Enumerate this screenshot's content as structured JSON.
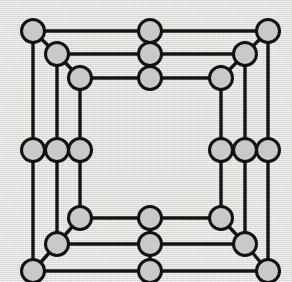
{
  "figure": {
    "canvas": {
      "width": 292,
      "height": 282
    },
    "style": {
      "background_color": "#f1f1ef",
      "edge_color": "#141414",
      "node_fill_color": "#c9c9c7",
      "node_stroke_color": "#121212",
      "edge_stroke_width": 3.4,
      "node_stroke_width": 3.0,
      "node_radius": 11.5
    },
    "counts": {
      "vertices": 24,
      "edges": 36,
      "rings": 3,
      "symmetry": "4-fold"
    }
  },
  "chart_data": {
    "type": "scatter",
    "xlabel": "",
    "ylabel": "",
    "xlim": [
      0,
      292
    ],
    "ylim": [
      0,
      282
    ],
    "grid": false,
    "legend": "none",
    "nodes": [
      {
        "id": "n01",
        "label": "outer-top-left",
        "x": 33,
        "y": 31,
        "r": 11.5
      },
      {
        "id": "n02",
        "label": "mid-top-left",
        "x": 57,
        "y": 54,
        "r": 11.5
      },
      {
        "id": "n03",
        "label": "inner-top-left",
        "x": 80,
        "y": 78,
        "r": 11.5
      },
      {
        "id": "n04",
        "label": "outer-top-center",
        "x": 150,
        "y": 31,
        "r": 11.5
      },
      {
        "id": "n05",
        "label": "mid-top-center",
        "x": 150,
        "y": 54,
        "r": 11.5
      },
      {
        "id": "n06",
        "label": "inner-top-center",
        "x": 150,
        "y": 78,
        "r": 11.5
      },
      {
        "id": "n07",
        "label": "outer-top-right",
        "x": 268,
        "y": 31,
        "r": 11.5
      },
      {
        "id": "n08",
        "label": "mid-top-right",
        "x": 245,
        "y": 54,
        "r": 11.5
      },
      {
        "id": "n09",
        "label": "inner-top-right",
        "x": 221,
        "y": 78,
        "r": 11.5
      },
      {
        "id": "n10",
        "label": "outer-left-middle",
        "x": 33,
        "y": 150,
        "r": 11.5
      },
      {
        "id": "n11",
        "label": "mid-left-middle",
        "x": 57,
        "y": 150,
        "r": 11.5
      },
      {
        "id": "n12",
        "label": "inner-left-middle",
        "x": 80,
        "y": 150,
        "r": 11.5
      },
      {
        "id": "n13",
        "label": "inner-right-middle",
        "x": 221,
        "y": 150,
        "r": 11.5
      },
      {
        "id": "n14",
        "label": "mid-right-middle",
        "x": 245,
        "y": 150,
        "r": 11.5
      },
      {
        "id": "n15",
        "label": "outer-right-middle",
        "x": 268,
        "y": 150,
        "r": 11.5
      },
      {
        "id": "n16",
        "label": "inner-bottom-left",
        "x": 80,
        "y": 218,
        "r": 11.5
      },
      {
        "id": "n17",
        "label": "mid-bottom-left",
        "x": 57,
        "y": 244,
        "r": 11.5
      },
      {
        "id": "n18",
        "label": "outer-bottom-left",
        "x": 33,
        "y": 271,
        "r": 11.5
      },
      {
        "id": "n19",
        "label": "inner-bottom-center",
        "x": 150,
        "y": 218,
        "r": 11.5
      },
      {
        "id": "n20",
        "label": "mid-bottom-center",
        "x": 150,
        "y": 244,
        "r": 11.5
      },
      {
        "id": "n21",
        "label": "outer-bottom-center",
        "x": 150,
        "y": 271,
        "r": 11.5
      },
      {
        "id": "n22",
        "label": "inner-bottom-right",
        "x": 221,
        "y": 218,
        "r": 11.5
      },
      {
        "id": "n23",
        "label": "mid-bottom-right",
        "x": 245,
        "y": 244,
        "r": 11.5
      },
      {
        "id": "n24",
        "label": "outer-bottom-right",
        "x": 268,
        "y": 271,
        "r": 11.5
      }
    ],
    "edges": [
      {
        "from": "n01",
        "to": "n04",
        "kind": "horizontal"
      },
      {
        "from": "n04",
        "to": "n07",
        "kind": "horizontal"
      },
      {
        "from": "n02",
        "to": "n05",
        "kind": "horizontal"
      },
      {
        "from": "n05",
        "to": "n08",
        "kind": "horizontal"
      },
      {
        "from": "n03",
        "to": "n06",
        "kind": "horizontal"
      },
      {
        "from": "n06",
        "to": "n09",
        "kind": "horizontal"
      },
      {
        "from": "n18",
        "to": "n21",
        "kind": "horizontal"
      },
      {
        "from": "n21",
        "to": "n24",
        "kind": "horizontal"
      },
      {
        "from": "n17",
        "to": "n20",
        "kind": "horizontal"
      },
      {
        "from": "n20",
        "to": "n23",
        "kind": "horizontal"
      },
      {
        "from": "n16",
        "to": "n19",
        "kind": "horizontal"
      },
      {
        "from": "n19",
        "to": "n22",
        "kind": "horizontal"
      },
      {
        "from": "n10",
        "to": "n11",
        "kind": "horizontal"
      },
      {
        "from": "n11",
        "to": "n12",
        "kind": "horizontal"
      },
      {
        "from": "n13",
        "to": "n14",
        "kind": "horizontal"
      },
      {
        "from": "n14",
        "to": "n15",
        "kind": "horizontal"
      },
      {
        "from": "n01",
        "to": "n10",
        "kind": "vertical"
      },
      {
        "from": "n10",
        "to": "n18",
        "kind": "vertical"
      },
      {
        "from": "n02",
        "to": "n11",
        "kind": "vertical"
      },
      {
        "from": "n11",
        "to": "n17",
        "kind": "vertical"
      },
      {
        "from": "n03",
        "to": "n12",
        "kind": "vertical"
      },
      {
        "from": "n12",
        "to": "n16",
        "kind": "vertical"
      },
      {
        "from": "n07",
        "to": "n15",
        "kind": "vertical"
      },
      {
        "from": "n15",
        "to": "n24",
        "kind": "vertical"
      },
      {
        "from": "n08",
        "to": "n14",
        "kind": "vertical"
      },
      {
        "from": "n14",
        "to": "n23",
        "kind": "vertical"
      },
      {
        "from": "n09",
        "to": "n13",
        "kind": "vertical"
      },
      {
        "from": "n13",
        "to": "n22",
        "kind": "vertical"
      },
      {
        "from": "n04",
        "to": "n05",
        "kind": "vertical"
      },
      {
        "from": "n05",
        "to": "n06",
        "kind": "vertical"
      },
      {
        "from": "n19",
        "to": "n20",
        "kind": "vertical"
      },
      {
        "from": "n20",
        "to": "n21",
        "kind": "vertical"
      },
      {
        "from": "n01",
        "to": "n02",
        "kind": "diagonal"
      },
      {
        "from": "n02",
        "to": "n03",
        "kind": "diagonal"
      },
      {
        "from": "n07",
        "to": "n08",
        "kind": "diagonal"
      },
      {
        "from": "n08",
        "to": "n09",
        "kind": "diagonal"
      },
      {
        "from": "n18",
        "to": "n17",
        "kind": "diagonal"
      },
      {
        "from": "n17",
        "to": "n16",
        "kind": "diagonal"
      },
      {
        "from": "n24",
        "to": "n23",
        "kind": "diagonal"
      },
      {
        "from": "n23",
        "to": "n22",
        "kind": "diagonal"
      }
    ]
  }
}
